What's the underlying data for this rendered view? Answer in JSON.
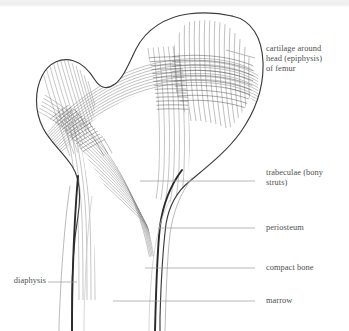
{
  "figure": {
    "subject": "femur",
    "background_color": "#ffffff",
    "ink_color": "#3b3b3b",
    "trabeculae_color": "#8d8d8d",
    "label_color": "#4f4f4f",
    "leader_color": "#9a9a9a"
  },
  "labels": [
    {
      "id": "cartilage",
      "text": "cartilage around\nhead (epiphysis)\nof femur",
      "side": "right",
      "x": 266,
      "y": 48,
      "leader": {
        "x1": 255,
        "y1": 58,
        "x2": 226,
        "y2": 50
      }
    },
    {
      "id": "trabeculae",
      "text": "trabeculae (bony\nstruts)",
      "side": "right",
      "x": 266,
      "y": 172,
      "leader": {
        "x1": 255,
        "y1": 181,
        "x2": 140,
        "y2": 181
      }
    },
    {
      "id": "periosteum",
      "text": "periosteum",
      "side": "right",
      "x": 266,
      "y": 222,
      "leader": {
        "x1": 255,
        "y1": 228,
        "x2": 158,
        "y2": 228
      }
    },
    {
      "id": "compact-bone",
      "text": "compact bone",
      "side": "right",
      "x": 266,
      "y": 262,
      "leader": {
        "x1": 255,
        "y1": 268,
        "x2": 145,
        "y2": 268
      }
    },
    {
      "id": "marrow",
      "text": "marrow",
      "side": "right",
      "x": 266,
      "y": 296,
      "leader": {
        "x1": 255,
        "y1": 301,
        "x2": 113,
        "y2": 301
      }
    },
    {
      "id": "diaphysis",
      "text": "diaphysis",
      "side": "left",
      "x": 2,
      "y": 276,
      "leader": {
        "x1": 48,
        "y1": 282,
        "x2": 77,
        "y2": 282
      }
    }
  ],
  "structures": [
    {
      "id": "femoral-head",
      "name": "head of femur"
    },
    {
      "id": "greater-trochanter",
      "name": "greater trochanter"
    },
    {
      "id": "femoral-neck",
      "name": "neck of femur"
    },
    {
      "id": "shaft",
      "name": "shaft (diaphysis)"
    },
    {
      "id": "medullary-cavity",
      "name": "marrow cavity"
    }
  ]
}
